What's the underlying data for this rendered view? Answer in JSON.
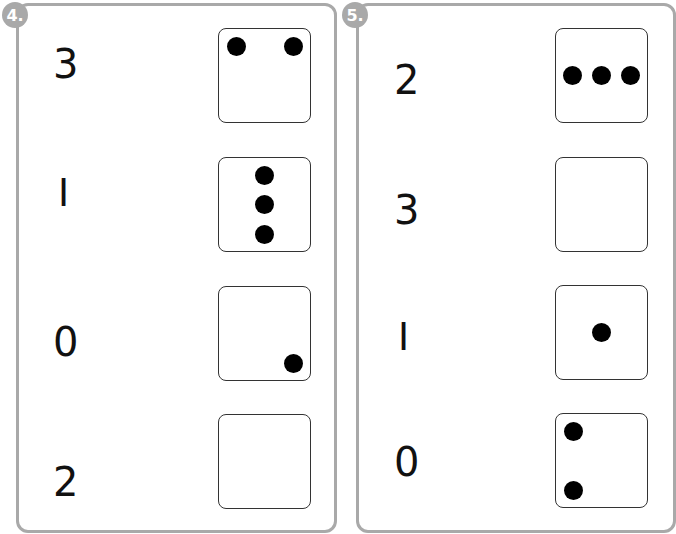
{
  "exercises": [
    {
      "number_label": "4.",
      "rows": [
        {
          "numeral": "3",
          "dots": 2,
          "layout": "top-left, top-right"
        },
        {
          "numeral": "I",
          "dots": 3,
          "layout": "vertical column, center"
        },
        {
          "numeral": "0",
          "dots": 1,
          "layout": "bottom-right"
        },
        {
          "numeral": "2",
          "dots": 0,
          "layout": "empty"
        }
      ]
    },
    {
      "number_label": "5.",
      "rows": [
        {
          "numeral": "2",
          "dots": 3,
          "layout": "horizontal row, middle"
        },
        {
          "numeral": "3",
          "dots": 0,
          "layout": "empty"
        },
        {
          "numeral": "I",
          "dots": 1,
          "layout": "center"
        },
        {
          "numeral": "0",
          "dots": 2,
          "layout": "top-left, bottom-left"
        }
      ]
    }
  ],
  "colors": {
    "panel_border": "#a9a9a9",
    "badge_bg": "#a9a9a9",
    "dot": "#000000",
    "die_border": "#333333"
  }
}
